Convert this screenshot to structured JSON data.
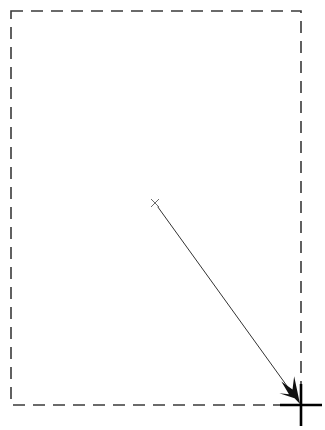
{
  "canvas": {
    "width": 325,
    "height": 430,
    "background_color": "#ffffff"
  },
  "region_box": {
    "label": "screen-region-boundary",
    "x": 11,
    "y": 11,
    "width": 290,
    "height": 394,
    "stroke_color": "#3a3a3a",
    "stroke_width": 1.6,
    "dash_length": 12,
    "gap_length": 8,
    "fill": "none"
  },
  "drag_arrow": {
    "label": "drag-path-arrow",
    "start_x": 155,
    "start_y": 203,
    "end_x": 300,
    "end_y": 404,
    "stroke_color": "#333333",
    "stroke_width": 1,
    "start_marker": "x-marker",
    "end_marker": "arrowhead",
    "arrowhead_color": "#111111",
    "arrowhead_length": 26,
    "arrowhead_half_width": 11
  },
  "start_marker": {
    "label": "drag-start-x-marker",
    "center_x": 155,
    "center_y": 203,
    "arm_length": 4,
    "stroke_color": "#6b6b6b",
    "stroke_width": 1
  },
  "cursor_crosshair": {
    "label": "cursor-crosshair",
    "center_x": 301,
    "center_y": 405,
    "arm_length": 21,
    "stroke_color": "#000000",
    "stroke_width": 2.6
  }
}
